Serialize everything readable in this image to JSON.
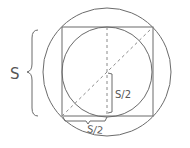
{
  "diagram": {
    "labels": {
      "side": "S",
      "half_vertical": "S/2",
      "half_horizontal": "S/2"
    },
    "colors": {
      "stroke": "#6b6b6b",
      "dashed": "#8a8a8a",
      "background": "#ffffff"
    },
    "shapes": {
      "outer_circle": {
        "cx": 107,
        "cy": 72,
        "r": 64
      },
      "square": {
        "x": 62,
        "y": 27,
        "size": 91
      },
      "inner_circle": {
        "cx": 107,
        "cy": 72,
        "r": 45
      }
    }
  }
}
